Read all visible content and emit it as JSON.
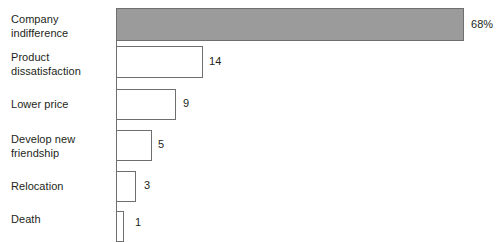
{
  "chart_data": {
    "type": "bar",
    "orientation": "horizontal",
    "title": "",
    "xlabel": "",
    "ylabel": "",
    "grid": false,
    "legend": false,
    "categories": [
      "Company indifference",
      "Product dissatisfaction",
      "Lower price",
      "Develop new friendship",
      "Relocation",
      "Death"
    ],
    "values": [
      68,
      14,
      9,
      5,
      3,
      1
    ],
    "value_labels": [
      "68%",
      "14",
      "9",
      "5",
      "3",
      "1"
    ],
    "bars": [
      {
        "category": "Company indifference",
        "label_lines": [
          "Company",
          "indifference"
        ],
        "value": 68,
        "value_label": "68%",
        "style": "filled",
        "fill": "#9b9b9b",
        "stroke": "#6f6f6f",
        "top": 8,
        "height": 33,
        "width": 348,
        "label_top": 13,
        "value_left": 471,
        "value_top": 18
      },
      {
        "category": "Product dissatisfaction",
        "label_lines": [
          "Product",
          "dissatisfaction"
        ],
        "value": 14,
        "value_label": "14",
        "style": "hollow",
        "fill": "#ffffff",
        "stroke": "#6f6f6f",
        "top": 46,
        "height": 32,
        "width": 87,
        "label_top": 51,
        "value_left": 209,
        "value_top": 55
      },
      {
        "category": "Lower price",
        "label_lines": [
          "Lower price"
        ],
        "value": 9,
        "value_label": "9",
        "style": "hollow",
        "fill": "#ffffff",
        "stroke": "#6f6f6f",
        "top": 89,
        "height": 31,
        "width": 60,
        "label_top": 98,
        "value_left": 183,
        "value_top": 97
      },
      {
        "category": "Develop new friendship",
        "label_lines": [
          "Develop new",
          "friendship"
        ],
        "value": 5,
        "value_label": "5",
        "style": "hollow",
        "fill": "#ffffff",
        "stroke": "#6f6f6f",
        "top": 130,
        "height": 31,
        "width": 36,
        "label_top": 133,
        "value_left": 158,
        "value_top": 138
      },
      {
        "category": "Relocation",
        "label_lines": [
          "Relocation"
        ],
        "value": 3,
        "value_label": "3",
        "style": "hollow",
        "fill": "#ffffff",
        "stroke": "#6f6f6f",
        "top": 171,
        "height": 31,
        "width": 20,
        "label_top": 180,
        "value_left": 144,
        "value_top": 179
      },
      {
        "category": "Death",
        "label_lines": [
          "Death"
        ],
        "value": 1,
        "value_label": "1",
        "style": "hollow",
        "fill": "#ffffff",
        "stroke": "#6f6f6f",
        "top": 211,
        "height": 31,
        "width": 8,
        "label_top": 213,
        "value_left": 135,
        "value_top": 216
      }
    ],
    "axis": {
      "line_color": "#6f6f6f",
      "left": 116,
      "top": 8,
      "height": 234
    },
    "background": "#ffffff"
  }
}
